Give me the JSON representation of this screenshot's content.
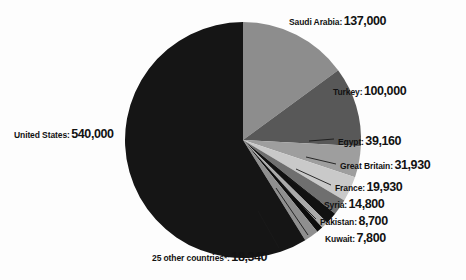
{
  "chart_data": {
    "type": "pie",
    "title": "",
    "subtitle": "",
    "xlabel": "",
    "ylabel": "",
    "legend_position": "callout-labels",
    "grid": false,
    "units": "people",
    "total": 918660,
    "categories": [
      "United States",
      "Saudi Arabia",
      "Turkey",
      "Egypt",
      "Great Britain",
      "France",
      "Syria",
      "Pakistan",
      "Kuwait",
      "25 other countries*"
    ],
    "values": [
      540000,
      137000,
      100000,
      39160,
      31930,
      19930,
      14800,
      8700,
      7800,
      18340
    ],
    "value_labels": [
      "540,000",
      "137,000",
      "100,000",
      "39,160",
      "31,930",
      "19,930",
      "14,800",
      "8,700",
      "7,800",
      "18,340"
    ],
    "colors": [
      "#151515",
      "#8d8d8d",
      "#585858",
      "#9e9e9e",
      "#c9c9c9",
      "#6f6f6f",
      "#111111",
      "#aaaaaa",
      "#0d0d0d",
      "#8f8f8f"
    ],
    "slices": [
      {
        "label": "United States",
        "value": 540000,
        "value_label": "540,000",
        "color": "#151515"
      },
      {
        "label": "Saudi Arabia",
        "value": 137000,
        "value_label": "137,000",
        "color": "#8d8d8d"
      },
      {
        "label": "Turkey",
        "value": 100000,
        "value_label": "100,000",
        "color": "#585858"
      },
      {
        "label": "Egypt",
        "value": 39160,
        "value_label": "39,160",
        "color": "#9e9e9e"
      },
      {
        "label": "Great Britain",
        "value": 31930,
        "value_label": "31,930",
        "color": "#c9c9c9"
      },
      {
        "label": "France",
        "value": 19930,
        "value_label": "19,930",
        "color": "#6f6f6f"
      },
      {
        "label": "Syria",
        "value": 14800,
        "value_label": "14,800",
        "color": "#111111"
      },
      {
        "label": "Pakistan",
        "value": 8700,
        "value_label": "8,700",
        "color": "#aaaaaa"
      },
      {
        "label": "Kuwait",
        "value": 7800,
        "value_label": "7,800",
        "color": "#0d0d0d"
      },
      {
        "label": "25 other countries*",
        "value": 18340,
        "value_label": "18,340",
        "color": "#8f8f8f"
      }
    ]
  },
  "labels": {
    "saudi_arabia": {
      "name": "Saudi Arabia:",
      "value": "137,000"
    },
    "turkey": {
      "name": "Turkey:",
      "value": "100,000"
    },
    "egypt": {
      "name": "Egypt:",
      "value": "39,160"
    },
    "great_britain": {
      "name": "Great Britain:",
      "value": "31,930"
    },
    "france": {
      "name": "France:",
      "value": "19,930"
    },
    "syria": {
      "name": "Syria:",
      "value": "14,800"
    },
    "pakistan": {
      "name": "Pakistan:",
      "value": "8,700"
    },
    "kuwait": {
      "name": "Kuwait:",
      "value": "7,800"
    },
    "other": {
      "name": "25 other countries*:",
      "value": "18,340"
    },
    "united_states": {
      "name": "United States:",
      "value": "540,000"
    }
  },
  "style": {
    "background": "#fdfdfd",
    "text_color": "#121212",
    "leader_line_color": "#1a1a1a"
  }
}
